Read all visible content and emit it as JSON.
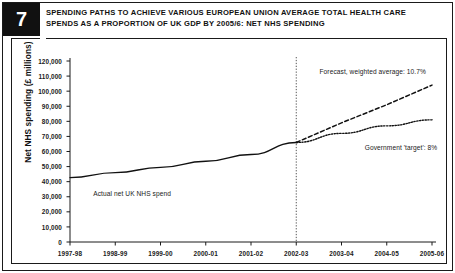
{
  "badge": {
    "number": "7"
  },
  "title": {
    "line1": "SPENDING PATHS TO ACHIEVE VARIOUS EUROPEAN UNION AVERAGE TOTAL HEALTH CARE",
    "line2": "SPENDS AS A PROPORTION OF UK GDP BY 2005/6: NET NHS SPENDING"
  },
  "chart_data": {
    "type": "line",
    "title": "SPENDING PATHS TO ACHIEVE VARIOUS EUROPEAN UNION AVERAGE TOTAL HEALTH CARE SPENDS AS A PROPORTION OF UK GDP BY 2005/6: NET NHS SPENDING",
    "xlabel": "",
    "ylabel": "Net NHS spending (£ millions)",
    "categories": [
      "1997-98",
      "1998-99",
      "1999-00",
      "2000-01",
      "2001-02",
      "2002-03",
      "2003-04",
      "2004-05",
      "2005-06"
    ],
    "ylim": [
      0,
      120000
    ],
    "ytick_values": [
      0,
      10000,
      20000,
      30000,
      40000,
      50000,
      60000,
      70000,
      80000,
      90000,
      100000,
      110000,
      120000
    ],
    "ytick_labels": [
      "0",
      "10,000",
      "20,000",
      "30,000",
      "40,000",
      "50,000",
      "60,000",
      "70,000",
      "80,000",
      "90,000",
      "100,000",
      "110,000",
      "120,000"
    ],
    "grid": false,
    "legend_position": "inline-annotations",
    "forecast_divider_at": "2002-03",
    "series": [
      {
        "name": "Actual net UK NHS spend",
        "style": "solid",
        "values": [
          42700,
          46000,
          49500,
          53500,
          58000,
          66000,
          null,
          null,
          null
        ]
      },
      {
        "name": "Forecast, weighted average: 10.7%",
        "style": "dashed",
        "values": [
          null,
          null,
          null,
          null,
          null,
          66000,
          79000,
          91000,
          104000
        ]
      },
      {
        "name": "Government 'target': 8%",
        "style": "dotted",
        "values": [
          null,
          null,
          null,
          null,
          null,
          66000,
          72000,
          77000,
          81000
        ]
      }
    ],
    "annotations": [
      {
        "text": "Actual net UK NHS spend",
        "x": "1998-99",
        "y": 32000
      },
      {
        "text": "Forecast, weighted average: 10.7%",
        "x": "2003-04",
        "y": 113000
      },
      {
        "text": "Government 'target': 8%",
        "x": "2004-05",
        "y": 62000
      }
    ]
  }
}
